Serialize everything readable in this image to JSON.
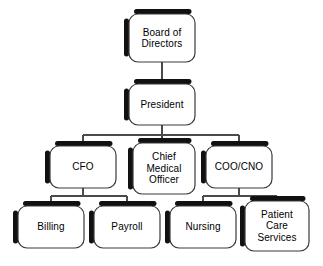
{
  "diagram": {
    "type": "organizational-chart",
    "background_color": "#ffffff",
    "box_fill_color": "#ffffff",
    "box_outline_color": "#3a3a3a",
    "box_shadow_color": "#111111",
    "connector_color": "#4a4a4a",
    "text_color": "#000000"
  },
  "nodes": {
    "board": {
      "label": "Board of\nDirectors",
      "level": 1,
      "x": 129,
      "y": 14,
      "w": 66,
      "h": 48
    },
    "president": {
      "label": "President",
      "level": 2,
      "x": 129,
      "y": 84,
      "w": 66,
      "h": 41
    },
    "cfo": {
      "label": "CFO",
      "level": 3,
      "x": 50,
      "y": 146,
      "w": 66,
      "h": 42
    },
    "cmo": {
      "label": "Chief\nMedical\nOfficer",
      "level": 3,
      "x": 133,
      "y": 143,
      "w": 62,
      "h": 51
    },
    "coo": {
      "label": "COO/CNO",
      "level": 3,
      "x": 206,
      "y": 146,
      "w": 66,
      "h": 42
    },
    "billing": {
      "label": "Billing",
      "level": 4,
      "x": 18,
      "y": 206,
      "w": 66,
      "h": 42
    },
    "payroll": {
      "label": "Payroll",
      "level": 4,
      "x": 94,
      "y": 206,
      "w": 66,
      "h": 42
    },
    "nursing": {
      "label": "Nursing",
      "level": 4,
      "x": 170,
      "y": 206,
      "w": 66,
      "h": 42
    },
    "patient_care": {
      "label": "Patient\nCare\nServices",
      "level": 4,
      "x": 245,
      "y": 201,
      "w": 64,
      "h": 50
    }
  },
  "edges": [
    {
      "from": "board",
      "to": "president"
    },
    {
      "from": "president",
      "to": "cfo"
    },
    {
      "from": "president",
      "to": "cmo"
    },
    {
      "from": "president",
      "to": "coo"
    },
    {
      "from": "cfo",
      "to": "billing"
    },
    {
      "from": "cfo",
      "to": "payroll"
    },
    {
      "from": "coo",
      "to": "nursing"
    },
    {
      "from": "coo",
      "to": "patient_care"
    }
  ]
}
